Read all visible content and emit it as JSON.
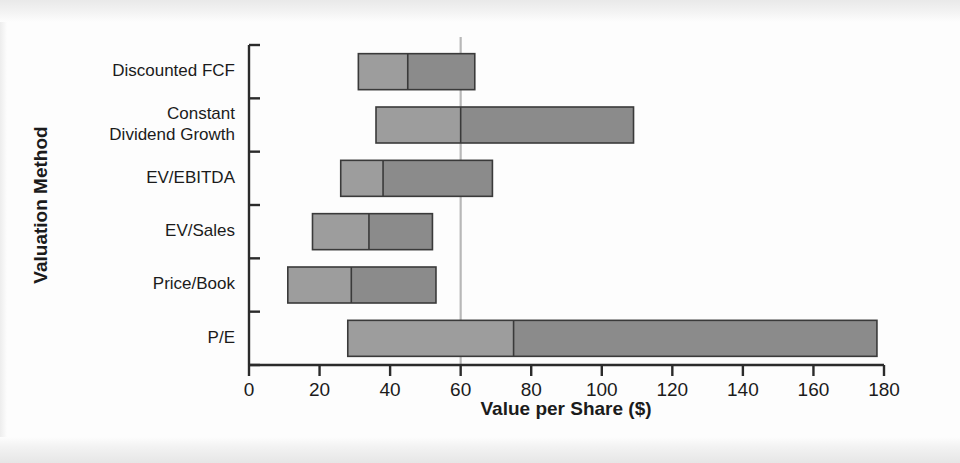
{
  "chart_data": {
    "type": "bar",
    "orientation": "horizontal",
    "title": "",
    "xlabel": "Value per Share ($)",
    "ylabel": "Valuation Method",
    "xlim": [
      0,
      180
    ],
    "ylim": null,
    "xticks": [
      0,
      20,
      40,
      60,
      80,
      100,
      120,
      140,
      160,
      180
    ],
    "xticklabels": [
      "0",
      "20",
      "40",
      "60",
      "80",
      "100",
      "120",
      "140",
      "160",
      "180"
    ],
    "grid": false,
    "legend": null,
    "categories": [
      "Discounted FCF",
      "Constant Dividend Growth",
      "EV/EBITDA",
      "EV/Sales",
      "Price/Book",
      "P/E"
    ],
    "category_label_lines": [
      [
        "Discounted FCF"
      ],
      [
        "Constant",
        "Dividend Growth"
      ],
      [
        "EV/EBITDA"
      ],
      [
        "EV/Sales"
      ],
      [
        "Price/Book"
      ],
      [
        "P/E"
      ]
    ],
    "annotations": [
      {
        "type": "vline",
        "value": 60,
        "label": "current share price reference line"
      }
    ],
    "bars": [
      {
        "category": "Discounted FCF",
        "low": 31,
        "mid": 45,
        "high": 64
      },
      {
        "category": "Constant Dividend Growth",
        "low": 36,
        "mid": 60,
        "high": 109
      },
      {
        "category": "EV/EBITDA",
        "low": 26,
        "mid": 38,
        "high": 69
      },
      {
        "category": "EV/Sales",
        "low": 18,
        "mid": 34,
        "high": 52
      },
      {
        "category": "Price/Book",
        "low": 11,
        "mid": 29,
        "high": 53
      },
      {
        "category": "P/E",
        "low": 28,
        "mid": 75,
        "high": 178
      }
    ],
    "colors": {
      "bar_low_segment": "#9d9d9d",
      "bar_high_segment": "#8b8b8b",
      "bar_outline": "#3a3a3a",
      "axis": "#2b2b2b",
      "reference_line": "#b8b8b8",
      "background": "#fdfdfd",
      "text": "#1b1b1b"
    }
  },
  "axis": {
    "x_title": "Value per Share ($)",
    "y_title": "Valuation Method"
  }
}
